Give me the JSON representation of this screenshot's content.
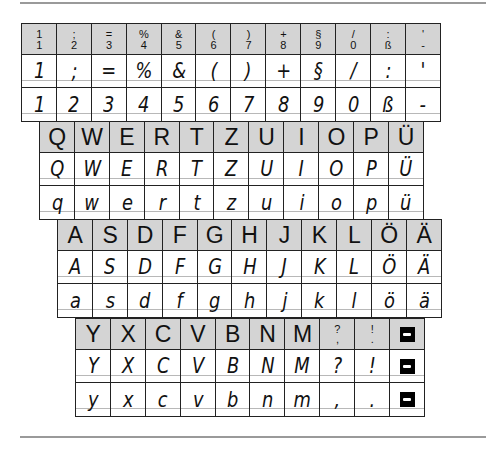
{
  "number_row": {
    "header": [
      {
        "upper": "1",
        "lower": "1"
      },
      {
        "upper": ";",
        "lower": "2"
      },
      {
        "upper": "=",
        "lower": "3"
      },
      {
        "upper": "%",
        "lower": "4"
      },
      {
        "upper": "&",
        "lower": "5"
      },
      {
        "upper": "(",
        "lower": "6"
      },
      {
        "upper": ")",
        "lower": "7"
      },
      {
        "upper": "+",
        "lower": "8"
      },
      {
        "upper": "§",
        "lower": "9"
      },
      {
        "upper": "/",
        "lower": "0"
      },
      {
        "upper": ":",
        "lower": "ß"
      },
      {
        "upper": "'",
        "lower": "-"
      }
    ],
    "shift": [
      "1",
      ";",
      "=",
      "%",
      "&",
      "(",
      ")",
      "+",
      "§",
      "/",
      ":",
      "'"
    ],
    "base": [
      "1",
      "2",
      "3",
      "4",
      "5",
      "6",
      "7",
      "8",
      "9",
      "0",
      "ß",
      "-"
    ]
  },
  "row_qwertz": {
    "header": [
      "Q",
      "W",
      "E",
      "R",
      "T",
      "Z",
      "U",
      "I",
      "O",
      "P",
      "Ü"
    ],
    "upper": [
      "Q",
      "W",
      "E",
      "R",
      "T",
      "Z",
      "U",
      "I",
      "O",
      "P",
      "Ü"
    ],
    "lower": [
      "q",
      "w",
      "e",
      "r",
      "t",
      "z",
      "u",
      "i",
      "o",
      "p",
      "ü"
    ]
  },
  "row_asdf": {
    "header": [
      "A",
      "S",
      "D",
      "F",
      "G",
      "H",
      "J",
      "K",
      "L",
      "Ö",
      "Ä"
    ],
    "upper": [
      "A",
      "S",
      "D",
      "F",
      "G",
      "H",
      "J",
      "K",
      "L",
      "Ö",
      "Ä"
    ],
    "lower": [
      "a",
      "s",
      "d",
      "f",
      "g",
      "h",
      "j",
      "k",
      "l",
      "ö",
      "ä"
    ]
  },
  "row_yxcv": {
    "header": [
      {
        "label": "Y"
      },
      {
        "label": "X"
      },
      {
        "label": "C"
      },
      {
        "label": "V"
      },
      {
        "label": "B"
      },
      {
        "label": "N"
      },
      {
        "label": "M"
      },
      {
        "upper": "?",
        "lower": ","
      },
      {
        "upper": "!",
        "lower": "."
      },
      {
        "icon": "space-key-icon"
      }
    ],
    "upper": [
      "Y",
      "X",
      "C",
      "V",
      "B",
      "N",
      "M",
      "?",
      "!",
      "space-key-icon"
    ],
    "lower": [
      "y",
      "x",
      "c",
      "v",
      "b",
      "n",
      "m",
      ",",
      ".",
      "space-key-icon"
    ]
  }
}
